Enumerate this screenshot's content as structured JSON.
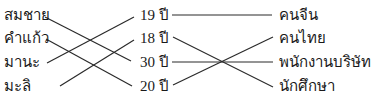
{
  "diagram": {
    "type": "matching",
    "left_column": {
      "items": [
        {
          "label": "สมชาย"
        },
        {
          "label": "คำแก้ว"
        },
        {
          "label": "มานะ"
        },
        {
          "label": "มะลิ"
        }
      ]
    },
    "middle_column": {
      "items": [
        {
          "label": "19 ปี"
        },
        {
          "label": "18 ปี"
        },
        {
          "label": "30 ปี"
        },
        {
          "label": "20 ปี"
        }
      ]
    },
    "right_column": {
      "items": [
        {
          "label": "คนจีน"
        },
        {
          "label": "คนไทย"
        },
        {
          "label": "พนักงานบริษัท"
        },
        {
          "label": "นักศึกษา"
        }
      ]
    },
    "connections": [
      {
        "from": "สมชาย",
        "to": "30 ปี"
      },
      {
        "from": "คำแก้ว",
        "to": "20 ปี"
      },
      {
        "from": "มานะ",
        "to": "19 ปี"
      },
      {
        "from": "มะลิ",
        "to": "18 ปี"
      },
      {
        "from": "19 ปี",
        "to": "คนจีน"
      },
      {
        "from": "18 ปี",
        "to": "นักศึกษา"
      },
      {
        "from": "30 ปี",
        "to": "พนักงานบริษัท"
      },
      {
        "from": "20 ปี",
        "to": "คนไทย"
      }
    ],
    "line_color": "#2a2a2a"
  }
}
